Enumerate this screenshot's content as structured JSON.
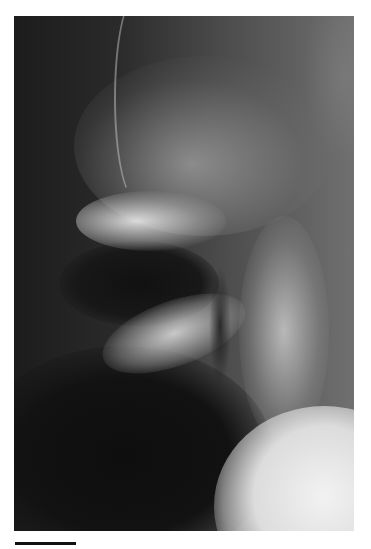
{
  "figure": {
    "type": "radiograph",
    "background_color": "#ffffff",
    "image_tone": "grayscale"
  },
  "scale_bar": {
    "label": "",
    "color": "#111111"
  }
}
